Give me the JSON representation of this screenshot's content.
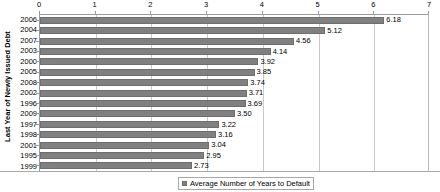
{
  "chart_data": {
    "type": "bar",
    "orientation": "horizontal",
    "title": "",
    "xlabel": "",
    "ylabel": "Last Year of Newly Issued Debt",
    "xlim": [
      0,
      7
    ],
    "xticks": [
      0,
      1,
      2,
      3,
      4,
      5,
      6,
      7
    ],
    "xtick_labels": [
      "0",
      "1",
      "2",
      "3",
      "4",
      "5",
      "6",
      "7"
    ],
    "xaxis_position": "top",
    "grid": "vertical",
    "legend_position": "bottom",
    "legend": [
      "Average Number of Years to Default"
    ],
    "series_name": "Average Number of Years to Default",
    "bar_color": "#808080",
    "categories": [
      "2006",
      "2004",
      "2007",
      "2003",
      "2000",
      "2005",
      "2008",
      "2002",
      "1996",
      "2009",
      "1997",
      "1998",
      "2001",
      "1995",
      "1999"
    ],
    "values": [
      6.18,
      5.12,
      4.56,
      4.14,
      3.92,
      3.85,
      3.74,
      3.71,
      3.69,
      3.5,
      3.22,
      3.16,
      3.04,
      2.95,
      2.73
    ],
    "data_labels": [
      "6.18",
      "5.12",
      "4.56",
      "4.14",
      "3.92",
      "3.85",
      "3.74",
      "3.71",
      "3.69",
      "3.50",
      "3.22",
      "3.16",
      "3.04",
      "2.95",
      "2.73"
    ],
    "points": [
      {
        "category": "2006",
        "value": 6.18,
        "label": "6.18"
      },
      {
        "category": "2004",
        "value": 5.12,
        "label": "5.12"
      },
      {
        "category": "2007",
        "value": 4.56,
        "label": "4.56"
      },
      {
        "category": "2003",
        "value": 4.14,
        "label": "4.14"
      },
      {
        "category": "2000",
        "value": 3.92,
        "label": "3.92"
      },
      {
        "category": "2005",
        "value": 3.85,
        "label": "3.85"
      },
      {
        "category": "2008",
        "value": 3.74,
        "label": "3.74"
      },
      {
        "category": "2002",
        "value": 3.71,
        "label": "3.71"
      },
      {
        "category": "1996",
        "value": 3.69,
        "label": "3.69"
      },
      {
        "category": "2009",
        "value": 3.5,
        "label": "3.50"
      },
      {
        "category": "1997",
        "value": 3.22,
        "label": "3.22"
      },
      {
        "category": "1998",
        "value": 3.16,
        "label": "3.16"
      },
      {
        "category": "2001",
        "value": 3.04,
        "label": "3.04"
      },
      {
        "category": "1995",
        "value": 2.95,
        "label": "2.95"
      },
      {
        "category": "1999",
        "value": 2.73,
        "label": "2.73"
      }
    ]
  }
}
